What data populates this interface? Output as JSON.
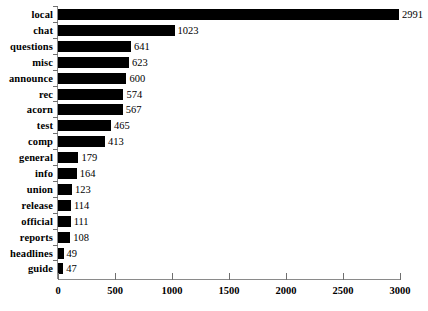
{
  "chart_data": {
    "type": "bar",
    "orientation": "horizontal",
    "title": "",
    "subtitle": "",
    "xlabel": "",
    "ylabel": "",
    "xlim": [
      0,
      3000
    ],
    "xticks": [
      0,
      500,
      1000,
      1500,
      2000,
      2500,
      3000
    ],
    "xtick_labels": [
      "0",
      "500",
      "1000",
      "1500",
      "2000",
      "2500",
      "3000"
    ],
    "grid": false,
    "legend": false,
    "bar_color": "#000000",
    "axis_color": "#8a8a8a",
    "background": "#ffffff",
    "value_labels_shown": true,
    "categories": [
      "local",
      "chat",
      "questions",
      "misc",
      "announce",
      "rec",
      "acorn",
      "test",
      "comp",
      "general",
      "info",
      "union",
      "release",
      "official",
      "reports",
      "headlines",
      "guide"
    ],
    "values": [
      2991,
      1023,
      641,
      623,
      600,
      574,
      567,
      465,
      413,
      179,
      164,
      123,
      114,
      111,
      108,
      49,
      47
    ],
    "value_label_texts": [
      "2991",
      "1023",
      "641",
      "623",
      "600",
      "574",
      "567",
      "465",
      "413",
      "179",
      "164",
      "123",
      "114",
      "111",
      "108",
      "49",
      "47"
    ]
  }
}
